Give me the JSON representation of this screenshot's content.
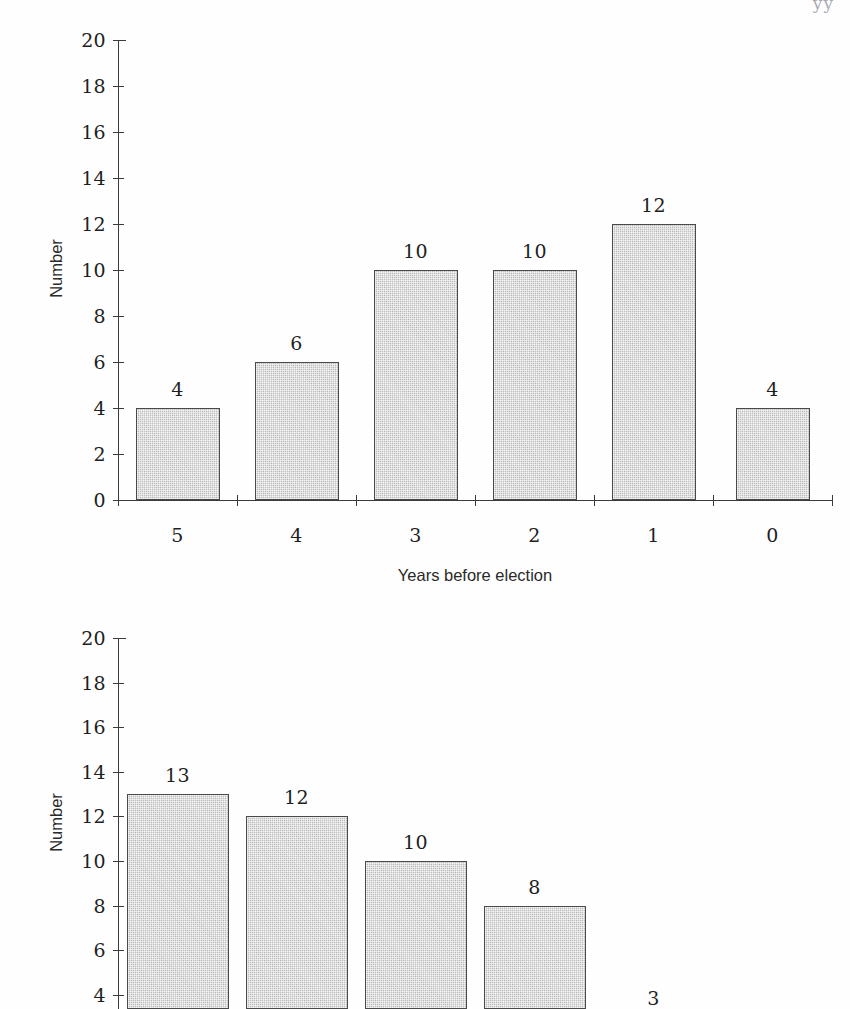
{
  "page": {
    "background": "#ffffff",
    "scan_artifact": "yy"
  },
  "colors": {
    "bar_fill": "#c2c2c2",
    "bar_border": "#4a4a4a",
    "axis": "#3a3a3a",
    "text": "#1f1f1f"
  },
  "chart_data": [
    {
      "id": "chart-top",
      "type": "bar",
      "title": "",
      "categories": [
        "5",
        "4",
        "3",
        "2",
        "1",
        "0"
      ],
      "values": [
        4,
        6,
        10,
        10,
        12,
        4
      ],
      "data_labels": [
        "4",
        "6",
        "10",
        "10",
        "12",
        "4"
      ],
      "xlabel": "Years before election",
      "ylabel": "Number",
      "ylim": [
        0,
        20
      ],
      "ytick_step": 2,
      "yticks": [
        "0",
        "2",
        "4",
        "6",
        "8",
        "10",
        "12",
        "14",
        "16",
        "18",
        "20"
      ],
      "grid": false,
      "legend": false
    },
    {
      "id": "chart-bottom",
      "type": "bar",
      "title": "",
      "categories": [
        "",
        "",
        "",
        "",
        "",
        ""
      ],
      "values": [
        13,
        12,
        10,
        8,
        3,
        null
      ],
      "data_labels": [
        "13",
        "12",
        "10",
        "8",
        "3",
        ""
      ],
      "xlabel": "",
      "ylabel": "Number",
      "ylim": [
        0,
        20
      ],
      "ytick_step": 2,
      "yticks": [
        "4",
        "6",
        "8",
        "10",
        "12",
        "14",
        "16",
        "18",
        "20"
      ],
      "grid": false,
      "legend": false,
      "note": "bottom of plot is cropped by the page edge"
    }
  ]
}
